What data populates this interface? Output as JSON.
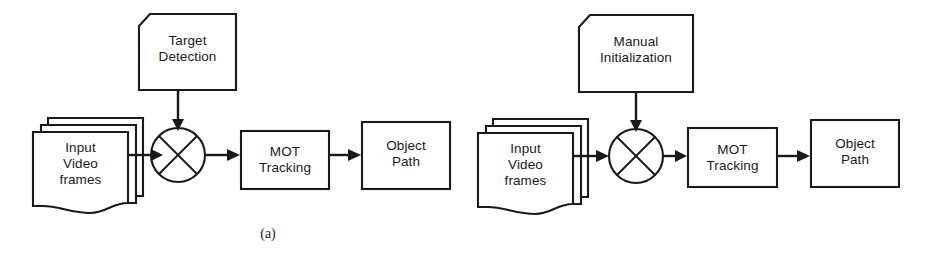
{
  "figure": {
    "width": 925,
    "height": 267,
    "background": "#ffffff",
    "stroke_color": "#1a1a1a",
    "text_color": "#1a1a1a"
  },
  "panels": [
    {
      "id": "a",
      "caption": "(a)",
      "source": {
        "label": "Input\nVideo\nframes",
        "shape": "stacked-pages"
      },
      "conditioning": {
        "label": "Target\nDetection",
        "shape": "clipped-corner-note"
      },
      "operator": {
        "label": "",
        "shape": "circle-with-x",
        "name": "multiply-node"
      },
      "process": {
        "label": "MOT\nTracking",
        "shape": "rectangle"
      },
      "output": {
        "label": "Object\nPath",
        "shape": "rectangle"
      },
      "edges": [
        {
          "from": "input-video-frames",
          "to": "multiply-node",
          "direction": "right"
        },
        {
          "from": "target-detection",
          "to": "multiply-node",
          "direction": "down"
        },
        {
          "from": "multiply-node",
          "to": "mot-tracking",
          "direction": "right"
        },
        {
          "from": "mot-tracking",
          "to": "object-path",
          "direction": "right"
        }
      ]
    },
    {
      "id": "b",
      "caption": "(b)",
      "source": {
        "label": "Input\nVideo\nframes",
        "shape": "stacked-pages"
      },
      "conditioning": {
        "label": "Manual\nInitialization",
        "shape": "clipped-corner-note"
      },
      "operator": {
        "label": "",
        "shape": "circle-with-x",
        "name": "multiply-node"
      },
      "process": {
        "label": "MOT\nTracking",
        "shape": "rectangle"
      },
      "output": {
        "label": "Object\nPath",
        "shape": "rectangle"
      },
      "edges": [
        {
          "from": "input-video-frames",
          "to": "multiply-node",
          "direction": "right"
        },
        {
          "from": "manual-initialization",
          "to": "multiply-node",
          "direction": "down"
        },
        {
          "from": "multiply-node",
          "to": "mot-tracking",
          "direction": "right"
        },
        {
          "from": "mot-tracking",
          "to": "object-path",
          "direction": "right"
        }
      ]
    }
  ]
}
